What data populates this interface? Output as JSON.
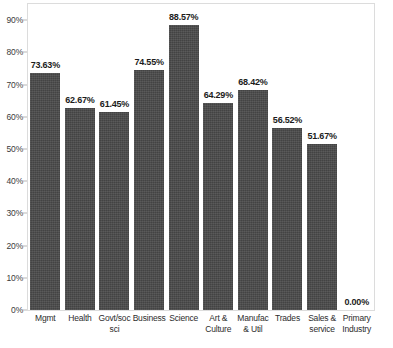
{
  "chart_data": {
    "type": "bar",
    "title": "",
    "subtitle": "",
    "xlabel": "",
    "ylabel": "",
    "ylim": [
      0,
      95
    ],
    "grid": false,
    "legend": false,
    "legend_position": "none",
    "bar_color": "#4a4a4a",
    "plot_border_color": "#dcdcdc",
    "value_label_format": "percent-2dp",
    "categories": [
      "Mgmt",
      "Health",
      "Govt/soc sci",
      "Business",
      "Science",
      "Art & Culture",
      "Manufac & Util",
      "Trades",
      "Sales & service",
      "Primary Industry"
    ],
    "category_label_lines": [
      [
        "Mgmt"
      ],
      [
        "Health"
      ],
      [
        "Govt/soc",
        "sci"
      ],
      [
        "Business"
      ],
      [
        "Science"
      ],
      [
        "Art &",
        "Culture"
      ],
      [
        "Manufac",
        "& Util"
      ],
      [
        "Trades"
      ],
      [
        "Sales &",
        "service"
      ],
      [
        "Primary",
        "Industry"
      ]
    ],
    "values": [
      73.63,
      62.67,
      61.45,
      74.55,
      88.57,
      64.29,
      68.42,
      56.52,
      51.67,
      0.0
    ],
    "value_labels": [
      "73.63%",
      "62.67%",
      "61.45%",
      "74.55%",
      "88.57%",
      "64.29%",
      "68.42%",
      "56.52%",
      "51.67%",
      "0.00%"
    ],
    "y_ticks": [
      0,
      10,
      20,
      30,
      40,
      50,
      60,
      70,
      80,
      90
    ],
    "y_tick_labels": [
      "0%",
      "10%",
      "20%",
      "30%",
      "40%",
      "50%",
      "60%",
      "70%",
      "80%",
      "90%"
    ]
  }
}
